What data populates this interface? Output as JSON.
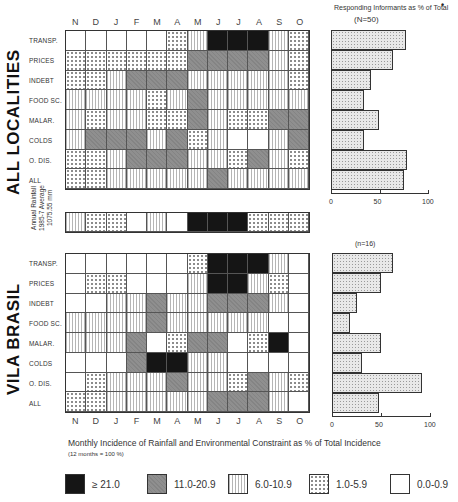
{
  "chart_data": {
    "type": "heatmap",
    "months": [
      "N",
      "D",
      "J",
      "F",
      "M",
      "A",
      "M",
      "J",
      "J",
      "A",
      "S",
      "O"
    ],
    "legend": [
      {
        "key": "black",
        "label": "≥ 21.0"
      },
      {
        "key": "grey",
        "label": "11.0-20.9"
      },
      {
        "key": "vert",
        "label": "6.0-10.9"
      },
      {
        "key": "dots",
        "label": "1.0-5.9"
      },
      {
        "key": "white",
        "label": "0.0-0.9"
      }
    ],
    "xlabel": "Monthly Incidence of Rainfall and Environmental Constraint as % of Total Incidence",
    "xlabel_note": "(12 months = 100 %)",
    "rainfall": {
      "label_lines": [
        "Annual Rainfall",
        "1985-7 Average",
        "1075.55 mm"
      ],
      "values": [
        "vert",
        "dots",
        "dots",
        "white",
        "vert",
        "white",
        "black",
        "black",
        "black",
        "dots",
        "dots",
        "dots"
      ]
    },
    "panels": [
      {
        "title": "ALL LOCALITIES",
        "bar_header": "Responding Informants as % of Total",
        "n_label": "(N=50)",
        "rows": [
          {
            "label": "TRANSP.",
            "cells": [
              "white",
              "white",
              "white",
              "white",
              "white",
              "dots",
              "vert",
              "black",
              "black",
              "black",
              "vert",
              "dots"
            ],
            "pct": 77
          },
          {
            "label": "PRICES",
            "cells": [
              "dots",
              "dots",
              "dots",
              "dots",
              "dots",
              "dots",
              "grey",
              "grey",
              "grey",
              "grey",
              "vert",
              "dots"
            ],
            "pct": 64
          },
          {
            "label": "INDEBT",
            "cells": [
              "dots",
              "dots",
              "vert",
              "grey",
              "grey",
              "grey",
              "vert",
              "vert",
              "vert",
              "vert",
              "vert",
              "dots"
            ],
            "pct": 41
          },
          {
            "label": "FOOD SC.",
            "cells": [
              "vert",
              "vert",
              "vert",
              "vert",
              "dots",
              "vert",
              "grey",
              "vert",
              "vert",
              "vert",
              "vert",
              "vert"
            ],
            "pct": 34
          },
          {
            "label": "MALAR.",
            "cells": [
              "vert",
              "dots",
              "vert",
              "vert",
              "dots",
              "dots",
              "grey",
              "vert",
              "dots",
              "dots",
              "grey",
              "grey"
            ],
            "pct": 49
          },
          {
            "label": "COLDS",
            "cells": [
              "vert",
              "grey",
              "grey",
              "grey",
              "vert",
              "grey",
              "dots",
              "vert",
              "white",
              "white",
              "vert",
              "grey"
            ],
            "pct": 34
          },
          {
            "label": "O. DIS.",
            "cells": [
              "dots",
              "dots",
              "vert",
              "grey",
              "grey",
              "grey",
              "vert",
              "vert",
              "dots",
              "grey",
              "vert",
              "dots"
            ],
            "pct": 78
          },
          {
            "label": "ALL",
            "cells": [
              "dots",
              "dots",
              "vert",
              "vert",
              "vert",
              "vert",
              "vert",
              "grey",
              "vert",
              "vert",
              "vert",
              "vert"
            ],
            "pct": 75
          }
        ],
        "axis_ticks": [
          "0",
          "50",
          "100"
        ]
      },
      {
        "title": "VILA BRASIL",
        "n_label": "(n=16)",
        "rows": [
          {
            "label": "TRANSP.",
            "cells": [
              "white",
              "white",
              "white",
              "white",
              "white",
              "white",
              "dots",
              "black",
              "black",
              "black",
              "vert",
              "white"
            ],
            "pct": 62
          },
          {
            "label": "PRICES",
            "cells": [
              "white",
              "dots",
              "dots",
              "white",
              "white",
              "white",
              "vert",
              "black",
              "black",
              "vert",
              "dots",
              "white"
            ],
            "pct": 50
          },
          {
            "label": "INDEBT",
            "cells": [
              "white",
              "white",
              "vert",
              "vert",
              "grey",
              "vert",
              "vert",
              "grey",
              "grey",
              "grey",
              "vert",
              "white"
            ],
            "pct": 25
          },
          {
            "label": "FOOD SC.",
            "cells": [
              "vert",
              "vert",
              "vert",
              "vert",
              "grey",
              "vert",
              "vert",
              "vert",
              "vert",
              "vert",
              "white",
              "white"
            ],
            "pct": 18
          },
          {
            "label": "MALAR.",
            "cells": [
              "vert",
              "vert",
              "vert",
              "grey",
              "white",
              "dots",
              "grey",
              "grey",
              "white",
              "dots",
              "black",
              "white"
            ],
            "pct": 50
          },
          {
            "label": "COLDS",
            "cells": [
              "white",
              "white",
              "white",
              "grey",
              "black",
              "black",
              "vert",
              "vert",
              "white",
              "white",
              "white",
              "white"
            ],
            "pct": 31
          },
          {
            "label": "O. DIS.",
            "cells": [
              "white",
              "dots",
              "vert",
              "vert",
              "vert",
              "grey",
              "vert",
              "vert",
              "dots",
              "grey",
              "vert",
              "dots"
            ],
            "pct": 92
          },
          {
            "label": "ALL",
            "cells": [
              "dots",
              "dots",
              "vert",
              "vert",
              "vert",
              "vert",
              "vert",
              "grey",
              "grey",
              "grey",
              "vert",
              "white"
            ],
            "pct": 48
          }
        ],
        "axis_ticks": [
          "0",
          "50",
          "100"
        ]
      }
    ],
    "bar_xlim": [
      0,
      100
    ]
  }
}
